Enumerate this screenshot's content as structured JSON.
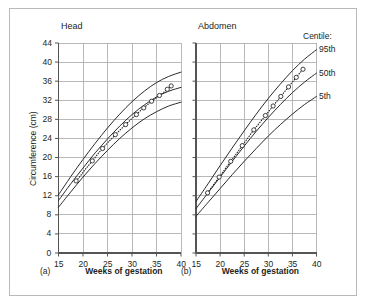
{
  "figure": {
    "border_color": "#b9b9b9",
    "grid_color": "#a8a8a8",
    "curve_color": "#231f20",
    "marker_color": "#231f20"
  },
  "legend": {
    "heading": "Centile:",
    "items": [
      {
        "label": "95th"
      },
      {
        "label": "50th"
      },
      {
        "label": "5th"
      }
    ]
  },
  "chart_data": [
    {
      "type": "line",
      "panel": "a",
      "panel_letter": "(a)",
      "title": "Head",
      "xlabel": "Weeks of gestation",
      "ylabel": "Circumference (cm)",
      "xlim": [
        15,
        40
      ],
      "ylim": [
        0,
        44
      ],
      "xticks": [
        15,
        20,
        25,
        30,
        35,
        40
      ],
      "yticks": [
        0,
        4,
        8,
        12,
        16,
        20,
        24,
        28,
        32,
        36,
        40,
        44
      ],
      "grid": true,
      "legend_position": "right-outside",
      "x": [
        15,
        17.5,
        20,
        22.5,
        25,
        27.5,
        30,
        32.5,
        35,
        37.5,
        40
      ],
      "series": [
        {
          "name": "95th",
          "values": [
            12.2,
            16.0,
            19.6,
            23.0,
            26.2,
            29.1,
            31.7,
            33.9,
            35.7,
            37.0,
            37.9
          ]
        },
        {
          "name": "50th",
          "values": [
            11.0,
            14.5,
            17.8,
            21.0,
            23.9,
            26.6,
            29.0,
            31.0,
            32.7,
            33.9,
            34.7
          ]
        },
        {
          "name": "5th",
          "values": [
            9.6,
            12.8,
            15.9,
            18.8,
            21.5,
            24.0,
            26.2,
            28.1,
            29.6,
            30.8,
            31.6
          ]
        }
      ],
      "measured": {
        "name": "measured",
        "x": [
          18.6,
          19.5,
          20.3,
          21.1,
          21.9,
          22.6,
          23.3,
          24.0,
          24.6,
          25.3,
          26.0,
          26.6,
          27.3,
          28.0,
          28.7,
          29.4,
          30.1,
          30.9,
          31.6,
          32.4,
          33.2,
          34.0,
          34.8,
          35.6,
          36.4,
          37.2,
          38.0
        ],
        "y": [
          15.1,
          16.2,
          17.3,
          18.3,
          19.3,
          20.2,
          21.1,
          21.9,
          22.6,
          23.4,
          24.1,
          24.8,
          25.5,
          26.2,
          26.9,
          27.6,
          28.3,
          29.0,
          29.7,
          30.4,
          31.1,
          31.8,
          32.4,
          33.0,
          33.6,
          34.3,
          35.0
        ],
        "marker_x": [
          18.6,
          21.9,
          24.0,
          26.6,
          28.7,
          30.9,
          32.4,
          34.0,
          35.6,
          37.2,
          38.0
        ],
        "marker_y": [
          15.1,
          19.3,
          21.9,
          24.8,
          26.9,
          29.0,
          30.4,
          31.8,
          33.0,
          34.3,
          35.0
        ]
      }
    },
    {
      "type": "line",
      "panel": "b",
      "panel_letter": "(b)",
      "title": "Abdomen",
      "xlabel": "Weeks of gestation",
      "ylabel": "Circumference (cm)",
      "xlim": [
        15,
        40
      ],
      "ylim": [
        0,
        44
      ],
      "xticks": [
        15,
        20,
        25,
        30,
        35,
        40
      ],
      "yticks": [
        0,
        4,
        8,
        12,
        16,
        20,
        24,
        28,
        32,
        36,
        40,
        44
      ],
      "grid": true,
      "legend_position": "right-outside",
      "x": [
        15,
        17.5,
        20,
        22.5,
        25,
        27.5,
        30,
        32.5,
        35,
        37.5,
        40
      ],
      "series": [
        {
          "name": "95th",
          "values": [
            10.8,
            14.5,
            18.3,
            22.0,
            25.6,
            29.1,
            32.4,
            35.4,
            38.2,
            40.6,
            42.6
          ]
        },
        {
          "name": "50th",
          "values": [
            9.3,
            12.6,
            15.9,
            19.2,
            22.4,
            25.5,
            28.4,
            31.1,
            33.6,
            35.8,
            37.7
          ]
        },
        {
          "name": "5th",
          "values": [
            7.7,
            10.6,
            13.5,
            16.4,
            19.2,
            21.9,
            24.5,
            26.9,
            29.1,
            31.1,
            32.8
          ]
        }
      ],
      "measured": {
        "name": "measured",
        "x": [
          17.4,
          18.2,
          19.0,
          19.8,
          20.6,
          21.4,
          22.2,
          23.0,
          23.8,
          24.6,
          25.4,
          26.2,
          27.0,
          27.8,
          28.6,
          29.4,
          30.2,
          31.0,
          31.8,
          32.6,
          33.4,
          34.2,
          35.0,
          35.8,
          36.6,
          37.2
        ],
        "y": [
          12.6,
          13.7,
          14.8,
          15.9,
          17.0,
          18.1,
          19.2,
          20.3,
          21.4,
          22.5,
          23.6,
          24.7,
          25.8,
          26.8,
          27.8,
          28.8,
          29.8,
          30.8,
          31.8,
          32.8,
          33.8,
          34.8,
          35.8,
          36.8,
          37.8,
          38.5
        ],
        "marker_x": [
          17.4,
          19.8,
          22.2,
          24.6,
          27.0,
          29.4,
          31.0,
          32.6,
          34.2,
          35.8,
          37.2
        ],
        "marker_y": [
          12.6,
          15.9,
          19.2,
          22.5,
          25.8,
          28.8,
          30.8,
          32.8,
          34.8,
          36.8,
          38.5
        ]
      }
    }
  ]
}
